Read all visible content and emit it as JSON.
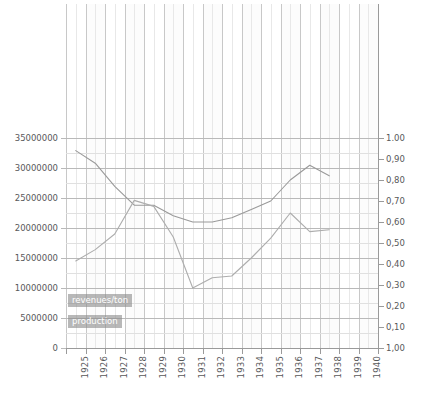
{
  "chart_data": {
    "type": "line",
    "title": "",
    "xlabel": "",
    "ylabel_left": "",
    "ylabel_right": "",
    "grid": true,
    "legend_position": "inside-bottom-left",
    "x": [
      1925,
      1926,
      1927,
      1928,
      1929,
      1930,
      1931,
      1932,
      1933,
      1934,
      1935,
      1936,
      1937,
      1938,
      1939,
      1940
    ],
    "xtick_labels": [
      "1925",
      "1926",
      "1927",
      "1928",
      "1929",
      "1930",
      "1931",
      "1932",
      "1933",
      "1934",
      "1935",
      "1936",
      "1937",
      "1938",
      "1939",
      "1940"
    ],
    "ytick_labels_left": [
      "35000000",
      "30000000",
      "25000000",
      "20000000",
      "15000000",
      "10000000",
      "5000000",
      "0"
    ],
    "ytick_values_left": [
      35000000,
      30000000,
      25000000,
      20000000,
      15000000,
      10000000,
      5000000,
      0
    ],
    "ytick_labels_right": [
      "1.00",
      "0,90",
      "0,80",
      "0,70",
      "0,60",
      "0,50",
      "0,40",
      "0,30",
      "0,20",
      "0,10",
      "1,00"
    ],
    "ytick_values_right": [
      1.0,
      0.9,
      0.8,
      0.7,
      0.6,
      0.5,
      0.4,
      0.3,
      0.2,
      0.1,
      0.0
    ],
    "ylim_left": [
      0,
      35000000
    ],
    "ylim_right": [
      0.0,
      1.0
    ],
    "series": [
      {
        "name": "revenues/ton",
        "axis": "right",
        "color": "#9a9a9a",
        "x": [
          1925,
          1926,
          1927,
          1928,
          1929,
          1930,
          1931,
          1932,
          1933,
          1934,
          1935,
          1936,
          1937,
          1938
        ],
        "values": [
          0.94,
          0.88,
          0.77,
          0.68,
          0.68,
          0.63,
          0.6,
          0.6,
          0.62,
          0.66,
          0.7,
          0.8,
          0.87,
          0.82
        ]
      },
      {
        "name": "production",
        "axis": "left",
        "color": "#adadad",
        "x": [
          1925,
          1926,
          1927,
          1928,
          1929,
          1930,
          1931,
          1932,
          1933,
          1934,
          1935,
          1936,
          1937,
          1938
        ],
        "values": [
          14500000,
          16400000,
          19000000,
          24600000,
          23600000,
          18500000,
          10000000,
          11700000,
          12000000,
          15000000,
          18300000,
          22500000,
          19400000,
          19700000
        ]
      }
    ]
  },
  "legend": {
    "items": [
      {
        "label": "revenues/ton"
      },
      {
        "label": "production"
      }
    ]
  },
  "colors": {
    "background": "#ffffff",
    "plot_background": "#fbfbfb",
    "gridline_major": "#b9b9b9",
    "gridline_minor": "#e2e2e2",
    "axis": "#9a9a9a",
    "text": "#58585a",
    "series_revenues": "#9a9a9a",
    "series_production": "#adadad",
    "legend_background": "rgba(140,140,140,0.62)"
  }
}
